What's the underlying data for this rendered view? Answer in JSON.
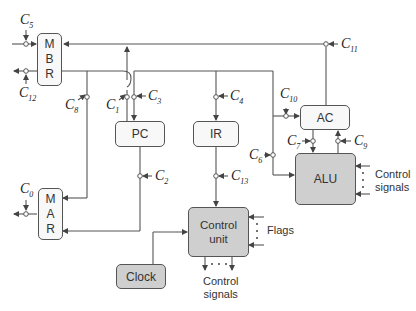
{
  "diagram": {
    "type": "cpu-datapath-block-diagram",
    "blocks": {
      "mbr": {
        "letters": [
          "M",
          "B",
          "R"
        ],
        "label": "MBR"
      },
      "mar": {
        "letters": [
          "M",
          "A",
          "R"
        ],
        "label": "MAR"
      },
      "pc": {
        "label": "PC"
      },
      "ir": {
        "label": "IR"
      },
      "ac": {
        "label": "AC"
      },
      "alu": {
        "label": "ALU"
      },
      "control_unit": {
        "line1": "Control",
        "line2": "unit"
      },
      "clock": {
        "label": "Clock"
      }
    },
    "control_points": {
      "c0": {
        "base": "C",
        "sub": "0"
      },
      "c1": {
        "base": "C",
        "sub": "1"
      },
      "c2": {
        "base": "C",
        "sub": "2"
      },
      "c3": {
        "base": "C",
        "sub": "3"
      },
      "c4": {
        "base": "C",
        "sub": "4"
      },
      "c5": {
        "base": "C",
        "sub": "5"
      },
      "c6": {
        "base": "C",
        "sub": "6"
      },
      "c7": {
        "base": "C",
        "sub": "7"
      },
      "c8": {
        "base": "C",
        "sub": "8"
      },
      "c9": {
        "base": "C",
        "sub": "9"
      },
      "c10": {
        "base": "C",
        "sub": "10"
      },
      "c11": {
        "base": "C",
        "sub": "11"
      },
      "c12": {
        "base": "C",
        "sub": "12"
      },
      "c13": {
        "base": "C",
        "sub": "13"
      }
    },
    "annotations": {
      "alu_control_line1": "Control",
      "alu_control_line2": "signals",
      "flags": "Flags",
      "cu_control_line1": "Control",
      "cu_control_line2": "signals"
    },
    "colors": {
      "line": "#444444",
      "light_box": "#f8f8f8",
      "gray_box": "#cfcfcf"
    }
  }
}
